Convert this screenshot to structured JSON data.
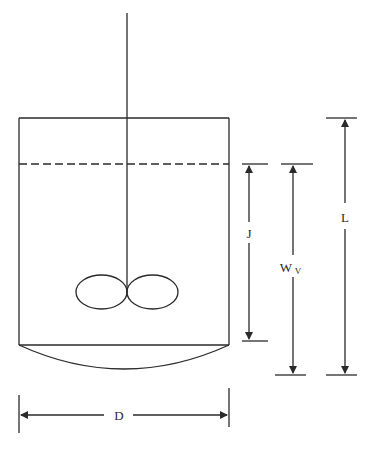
{
  "diagram": {
    "title": "",
    "type": "stirred-tank-vessel-dimensions",
    "labels": {
      "J": "J",
      "Wv_main": "W",
      "Wv_sub": "V",
      "L": "L",
      "D": "D"
    },
    "components": [
      "vessel",
      "liquid-level",
      "shaft",
      "impeller",
      "dished-bottom"
    ],
    "dimensions": [
      {
        "name": "J",
        "from": "liquid-level",
        "to": "vessel-bottom-edge"
      },
      {
        "name": "Wv",
        "from": "liquid-level",
        "to": "dish-bottom"
      },
      {
        "name": "L",
        "from": "vessel-top",
        "to": "dish-bottom"
      },
      {
        "name": "D",
        "from": "left-wall",
        "to": "right-wall"
      }
    ],
    "colors": {
      "stroke": "#2a2a2a",
      "background": "#ffffff"
    }
  }
}
